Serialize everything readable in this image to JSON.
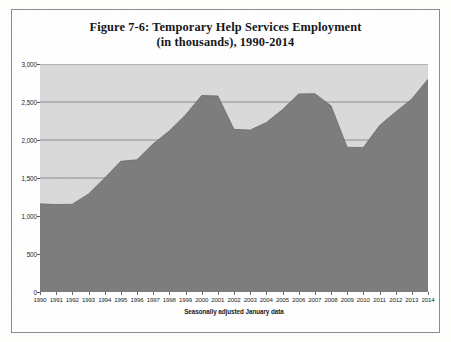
{
  "figure": {
    "title_line1": "Figure 7-6: Temporary Help Services Employment",
    "title_line2": "(in thousands), 1990-2014",
    "axis_note": "Seasonally adjusted January data"
  },
  "colors": {
    "page_background": "#fdfdfc",
    "plot_background": "#d9d9d9",
    "area_fill": "#7d7d7d",
    "gridline": "#6e6f72",
    "axis_text": "#1d1e21",
    "frame_border": "#8c8c8c"
  },
  "chart_data": {
    "type": "area",
    "title": "Figure 7-6: Temporary Help Services Employment (in thousands), 1990-2014",
    "subtitle": "Seasonally adjusted January data",
    "xlabel": "",
    "ylabel": "",
    "units": "thousands of jobs",
    "grid": true,
    "legend": "none",
    "ylim": [
      0,
      3000
    ],
    "ytick_values": [
      0,
      500,
      1000,
      1500,
      2000,
      2500,
      3000
    ],
    "ytick_labels": [
      "0",
      "500",
      "1,000",
      "1,500",
      "2,000",
      "2,500",
      "3,000"
    ],
    "categories": [
      "1990",
      "1991",
      "1992",
      "1993",
      "1994",
      "1995",
      "1996",
      "1997",
      "1998",
      "1999",
      "2000",
      "2001",
      "2002",
      "2003",
      "2004",
      "2005",
      "2006",
      "2007",
      "2008",
      "2009",
      "2010",
      "2011",
      "2012",
      "2013",
      "2014"
    ],
    "series": [
      {
        "name": "Temporary Help Services Employment",
        "values": [
          1160,
          1150,
          1155,
          1290,
          1500,
          1720,
          1740,
          1950,
          2120,
          2330,
          2585,
          2580,
          2140,
          2130,
          2230,
          2400,
          2605,
          2610,
          2450,
          1905,
          1900,
          2190,
          2370,
          2540,
          2800
        ]
      }
    ]
  },
  "x_axis": {
    "ticks": [
      "1990",
      "1991",
      "1992",
      "1993",
      "1994",
      "1995",
      "1996",
      "1997",
      "1998",
      "1999",
      "2000",
      "2001",
      "2002",
      "2003",
      "2004",
      "2005",
      "2006",
      "2007",
      "2008",
      "2009",
      "2010",
      "2011",
      "2012",
      "2013",
      "2014"
    ]
  },
  "y_axis": {
    "ticks": [
      "3,000",
      "2,500",
      "2,000",
      "1,500",
      "1,000",
      "500",
      "0"
    ]
  }
}
